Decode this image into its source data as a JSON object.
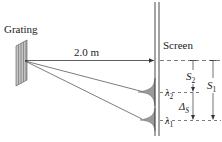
{
  "diagram": {
    "type": "diffraction-grating-setup",
    "labels": {
      "grating": "Grating",
      "screen": "Screen",
      "distance": "2.0 m",
      "lambda2_sym": "λ",
      "lambda2_sub": "2",
      "lambda1_sym": "λ",
      "lambda1_sub": "1",
      "s2_sym": "S",
      "s2_sub": "2",
      "s1_sym": "S",
      "s1_sub": "1",
      "delta_sym": "Δ",
      "delta_sub": "S"
    },
    "colors": {
      "line": "#333333",
      "grating_fill": "#bdbdbd",
      "peak_fill": "#9a9a9a",
      "background": "#ffffff"
    }
  }
}
